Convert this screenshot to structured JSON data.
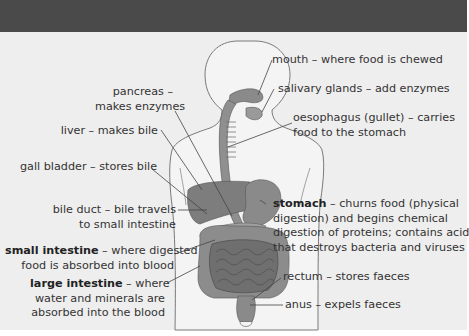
{
  "diagram": {
    "colors": {
      "top_band": "#4a4a4a",
      "panel": "#eeeeee",
      "body_outline": "#777777",
      "organ_fill": "#8a8a8a",
      "text": "#333333"
    },
    "labels": {
      "mouth": {
        "line1": "mouth – where food is chewed"
      },
      "salivary": {
        "line1": "salivary glands – add enzymes"
      },
      "oesophagus": {
        "line1": "oesophagus (gullet) – carries",
        "line2": "food to the stomach"
      },
      "pancreas": {
        "line1": "pancreas –",
        "line2": "makes enzymes"
      },
      "liver": {
        "line1": "liver – makes bile"
      },
      "gall_bladder": {
        "line1": "gall bladder – stores bile"
      },
      "bile_duct": {
        "line1": "bile duct – bile travels",
        "line2": "to small intestine"
      },
      "stomach": {
        "term": "stomach",
        "line1_rest": " – churns food (physical",
        "line2": "digestion) and begins chemical",
        "line3": "digestion of proteins; contains acid",
        "line4": "that destroys bacteria and viruses"
      },
      "small_intestine": {
        "term": "small intestine",
        "line1_rest": " – where digested",
        "line2": "food is absorbed  into blood"
      },
      "large_intestine": {
        "term": "large intestine",
        "line1_rest": " – where",
        "line2": "water and minerals are",
        "line3": "absorbed into the blood"
      },
      "rectum": {
        "line1": "rectum – stores faeces"
      },
      "anus": {
        "line1": "anus – expels faeces"
      }
    }
  }
}
